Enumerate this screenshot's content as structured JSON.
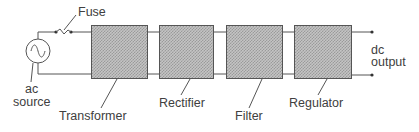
{
  "diagram": {
    "source": {
      "label_line1": "ac",
      "label_line2": "source",
      "icon": "ac-source-icon"
    },
    "fuse": {
      "label": "Fuse",
      "icon": "fuse-icon"
    },
    "blocks": [
      {
        "id": "transformer",
        "label": "Transformer"
      },
      {
        "id": "rectifier",
        "label": "Rectifier"
      },
      {
        "id": "filter",
        "label": "Filter"
      },
      {
        "id": "regulator",
        "label": "Regulator"
      }
    ],
    "output": {
      "label_line1": "dc",
      "label_line2": "output"
    },
    "colors": {
      "line": "#555555",
      "block_fill": "#bdbdbd",
      "text": "#404040"
    }
  }
}
